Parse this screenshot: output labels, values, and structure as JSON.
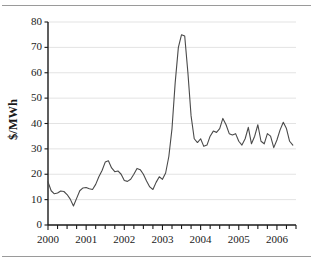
{
  "figure": {
    "background": "#ffffff",
    "line_color": "#4a4a4a",
    "axis_color": "#1a1a1a",
    "grid_color": "#e3e3e3",
    "rule_color": "#9a9a9a"
  },
  "chart_data": {
    "type": "line",
    "title": "",
    "subtitle": "",
    "xlabel": "",
    "ylabel": "$/MWh",
    "xlim": [
      2000.0,
      2006.5
    ],
    "ylim": [
      0,
      80
    ],
    "ytick_labels": [
      "0",
      "10",
      "20",
      "30",
      "40",
      "50",
      "60",
      "70",
      "80"
    ],
    "yticks": [
      0,
      10,
      20,
      30,
      40,
      50,
      60,
      70,
      80
    ],
    "xtick_labels": [
      "2000",
      "2001",
      "2002",
      "2003",
      "2004",
      "2005",
      "2006"
    ],
    "xticks": [
      2000,
      2001,
      2002,
      2003,
      2004,
      2005,
      2006
    ],
    "minor_xticks_per_year": 4,
    "grid": "horizontal",
    "legend": "none",
    "series": [
      {
        "name": "Electricity price",
        "color": "#4a4a4a",
        "x": [
          2000.0,
          2000.083,
          2000.167,
          2000.25,
          2000.333,
          2000.417,
          2000.5,
          2000.583,
          2000.667,
          2000.75,
          2000.833,
          2000.917,
          2001.0,
          2001.083,
          2001.167,
          2001.25,
          2001.333,
          2001.417,
          2001.5,
          2001.583,
          2001.667,
          2001.75,
          2001.833,
          2001.917,
          2002.0,
          2002.083,
          2002.167,
          2002.25,
          2002.333,
          2002.417,
          2002.5,
          2002.583,
          2002.667,
          2002.75,
          2002.833,
          2002.917,
          2003.0,
          2003.083,
          2003.167,
          2003.25,
          2003.333,
          2003.417,
          2003.5,
          2003.583,
          2003.667,
          2003.75,
          2003.833,
          2003.917,
          2004.0,
          2004.083,
          2004.167,
          2004.25,
          2004.333,
          2004.417,
          2004.5,
          2004.583,
          2004.667,
          2004.75,
          2004.833,
          2004.917,
          2005.0,
          2005.083,
          2005.167,
          2005.25,
          2005.333,
          2005.417,
          2005.5,
          2005.583,
          2005.667,
          2005.75,
          2005.833,
          2005.917,
          2006.0,
          2006.083,
          2006.167,
          2006.25,
          2006.333,
          2006.417
        ],
        "values": [
          17.0,
          13.5,
          12.3,
          12.6,
          13.4,
          13.2,
          12.0,
          10.2,
          7.5,
          10.5,
          13.5,
          14.6,
          14.8,
          14.3,
          14.0,
          16.0,
          19.0,
          21.5,
          24.8,
          25.3,
          22.5,
          21.0,
          21.3,
          20.0,
          17.5,
          17.2,
          18.0,
          20.0,
          22.3,
          21.8,
          20.0,
          17.3,
          15.0,
          14.0,
          16.8,
          19.0,
          18.0,
          20.5,
          27.0,
          38.0,
          56.0,
          70.0,
          75.0,
          74.5,
          60.0,
          43.0,
          34.0,
          32.5,
          34.0,
          31.0,
          31.5,
          35.0,
          37.0,
          36.5,
          38.0,
          42.0,
          39.5,
          36.0,
          35.5,
          36.0,
          33.0,
          31.5,
          34.0,
          38.5,
          32.0,
          35.0,
          39.5,
          33.0,
          32.0,
          36.0,
          35.0,
          30.5,
          33.5,
          37.5,
          40.5,
          38.0,
          33.0,
          31.5
        ]
      }
    ],
    "annotations": [
      {
        "label": "peak",
        "x": 2003.5,
        "y": 75.0
      },
      {
        "label": "trough",
        "x": 2000.667,
        "y": 7.5
      },
      {
        "label": "late-peak",
        "x": 2006.25,
        "y": 62.5
      }
    ]
  }
}
